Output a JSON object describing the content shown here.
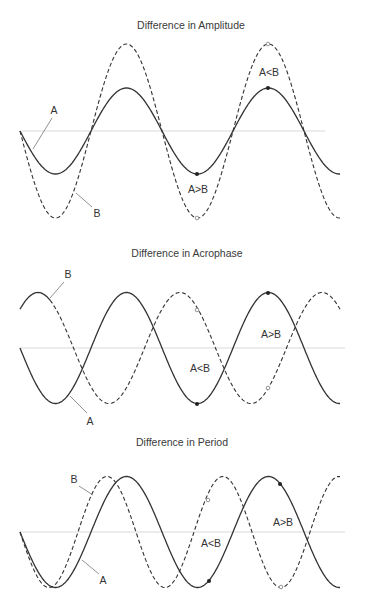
{
  "figure": {
    "width": 365,
    "height": 598,
    "colors": {
      "line": "#333333",
      "baseline": "#cfcfcf",
      "leader": "#777777"
    }
  },
  "panels": [
    {
      "id": "amplitude",
      "title": "Difference in Amplitude",
      "title_pos": [
        191,
        29
      ],
      "x_start": 20,
      "x_end": 340,
      "baseline_y": 131,
      "baseline_x": [
        22,
        325
      ],
      "series": [
        {
          "name": "A",
          "style": "solid",
          "amplitude": 43,
          "period": 142,
          "phase_x": 20,
          "direction": -1
        },
        {
          "name": "B",
          "style": "dashed",
          "amplitude": 87,
          "period": 142,
          "phase_x": 20,
          "direction": -1
        }
      ],
      "labels": [
        {
          "text": "A",
          "x": 54,
          "y": 114,
          "leader": [
            52,
            118,
            33,
            149
          ]
        },
        {
          "text": "B",
          "x": 97,
          "y": 217,
          "leader": [
            92,
            207,
            76,
            193
          ]
        },
        {
          "text": "A>B",
          "x": 198,
          "y": 193
        },
        {
          "text": "A<B",
          "x": 269,
          "y": 76
        }
      ],
      "markers": [
        {
          "x": 197,
          "y": 174,
          "type": "filled"
        },
        {
          "x": 197,
          "y": 218,
          "type": "hollow"
        },
        {
          "x": 268,
          "y": 88,
          "type": "filled"
        },
        {
          "x": 268,
          "y": 44,
          "type": "hollow"
        }
      ]
    },
    {
      "id": "acrophase",
      "title": "Difference in Acrophase",
      "title_pos": [
        187,
        257
      ],
      "x_start": 20,
      "x_end": 340,
      "baseline_y": 348,
      "baseline_x": [
        20,
        345
      ],
      "series": [
        {
          "name": "A",
          "style": "solid",
          "amplitude": 55.5,
          "period": 142,
          "phase_x": 20,
          "direction": -1
        },
        {
          "name": "B",
          "style": "mixed",
          "amplitude": 55.5,
          "period": 142,
          "phase_x": 2.5,
          "direction": 1
        }
      ],
      "labels": [
        {
          "text": "B",
          "x": 68,
          "y": 278,
          "leader": [
            64,
            282,
            50,
            298
          ]
        },
        {
          "text": "A",
          "x": 90,
          "y": 425,
          "leader": [
            87,
            413,
            70,
            396
          ]
        },
        {
          "text": "A<B",
          "x": 200,
          "y": 372
        },
        {
          "text": "A>B",
          "x": 271,
          "y": 338
        }
      ],
      "markers": [
        {
          "x": 197,
          "y": 404,
          "type": "filled"
        },
        {
          "x": 197,
          "y": 310,
          "type": "hollow"
        },
        {
          "x": 268,
          "y": 293,
          "type": "filled"
        },
        {
          "x": 268,
          "y": 388,
          "type": "hollow"
        }
      ]
    },
    {
      "id": "period",
      "title": "Difference in Period",
      "title_pos": [
        182,
        446
      ],
      "x_start": 20,
      "x_end": 340,
      "baseline_y": 532,
      "baseline_x": [
        20,
        345
      ],
      "series": [
        {
          "name": "A",
          "style": "solid",
          "amplitude": 55.5,
          "period": 142,
          "phase_x": 20,
          "direction": -1
        },
        {
          "name": "B",
          "style": "dashed",
          "amplitude": 55.5,
          "period": 116,
          "phase_x": 20,
          "direction": -1
        }
      ],
      "labels": [
        {
          "text": "B",
          "x": 74,
          "y": 483,
          "leader": [
            79,
            486,
            93,
            495
          ]
        },
        {
          "text": "A",
          "x": 103,
          "y": 584,
          "leader": [
            99,
            574,
            82,
            560
          ]
        },
        {
          "text": "A<B",
          "x": 211,
          "y": 547
        },
        {
          "text": "A>B",
          "x": 283,
          "y": 526
        }
      ],
      "markers": [
        {
          "x": 209,
          "y": 581,
          "type": "filled"
        },
        {
          "x": 208,
          "y": 500,
          "type": "hollow"
        },
        {
          "x": 280,
          "y": 484,
          "type": "filled"
        },
        {
          "x": 281,
          "y": 587,
          "type": "hollow"
        }
      ]
    }
  ]
}
